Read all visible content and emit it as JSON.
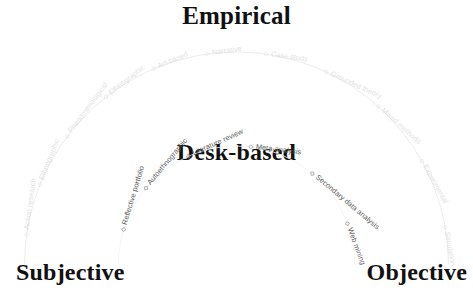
{
  "headings": {
    "top": "Empirical",
    "center": "Desk-based",
    "left": "Subjective",
    "right": "Objective"
  },
  "colors": {
    "heading_text": "#111111",
    "inner_label_text": "#5c5c5c",
    "outer_label_text": "#c9c9c9",
    "background": "#ffffff",
    "marker_stroke": "#8a8a8a"
  },
  "chart_data": {
    "type": "scatter",
    "title": "Empirical",
    "subtitle": "Desk-based",
    "xlabel": "",
    "ylabel": "",
    "grid": false,
    "legend_position": "none",
    "axes": {
      "left_pole": "Subjective",
      "right_pole": "Objective",
      "outer_arc_theme": "Empirical",
      "inner_arc_theme": "Desk-based"
    },
    "series": [
      {
        "name": "Empirical",
        "arc": "outer",
        "radius": 212,
        "marker": "open-diamond",
        "values": [
          {
            "label": "Action research",
            "angle_deg": 172
          },
          {
            "label": "Ethnographic",
            "angle_deg": 158
          },
          {
            "label": "Phenomenological",
            "angle_deg": 143
          },
          {
            "label": "Ethnographic",
            "angle_deg": 128
          },
          {
            "label": "Art-based",
            "angle_deg": 113
          },
          {
            "label": "Narrative",
            "angle_deg": 98
          },
          {
            "label": "Case study",
            "angle_deg": 82
          },
          {
            "label": "Grounded theory",
            "angle_deg": 65
          },
          {
            "label": "Mixed methods",
            "angle_deg": 48
          },
          {
            "label": "Experimental",
            "angle_deg": 29
          },
          {
            "label": "Simulation",
            "angle_deg": 10
          }
        ]
      },
      {
        "name": "Desk-based",
        "arc": "inner",
        "radius": 118,
        "marker": "open-diamond",
        "values": [
          {
            "label": "Reflective portfolio",
            "angle_deg": 163
          },
          {
            "label": "Autoethnographic",
            "angle_deg": 140
          },
          {
            "label": "Literature review",
            "angle_deg": 114
          },
          {
            "label": "Meta-analysis",
            "angle_deg": 83
          },
          {
            "label": "Secondary data analysis",
            "angle_deg": 50
          },
          {
            "label": "Web mining",
            "angle_deg": 20
          }
        ]
      }
    ]
  }
}
